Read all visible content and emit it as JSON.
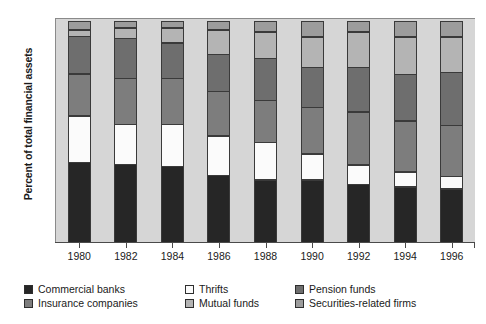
{
  "chart_data": {
    "type": "bar",
    "subtype": "stacked-100-percent",
    "title": "",
    "xlabel": "",
    "ylabel": "Percent of total financial assets",
    "ylim": [
      0,
      100
    ],
    "yticks": [
      0,
      20,
      40,
      60,
      80,
      100
    ],
    "grid": false,
    "legend_position": "bottom",
    "categories": [
      "1980",
      "1982",
      "1984",
      "1986",
      "1988",
      "1990",
      "1992",
      "1994",
      "1996"
    ],
    "series": [
      {
        "name": "Commercial banks",
        "color": "#262626",
        "values": [
          36,
          35,
          34,
          30,
          28,
          28,
          26,
          25,
          24
        ]
      },
      {
        "name": "Thrifts",
        "color": "#fbfbfb",
        "values": [
          21,
          18,
          19,
          18,
          17,
          12,
          9,
          7,
          6
        ]
      },
      {
        "name": "Insurance companies",
        "color": "#7d7d7d",
        "values": [
          19,
          21,
          21,
          20,
          19,
          21,
          24,
          23,
          23
        ]
      },
      {
        "name": "Pension funds",
        "color": "#6e6e6e",
        "values": [
          17,
          18,
          16,
          17,
          19,
          18,
          20,
          21,
          24
        ]
      },
      {
        "name": "Mutual funds",
        "color": "#b4b4b4",
        "values": [
          3,
          5,
          7,
          11,
          12,
          14,
          16,
          17,
          16
        ]
      },
      {
        "name": "Securities-related firms",
        "color": "#9c9c9c",
        "values": [
          4,
          3,
          3,
          4,
          5,
          7,
          5,
          7,
          7
        ]
      }
    ]
  },
  "legend": {
    "entries": [
      "Commercial banks",
      "Thrifts",
      "Pension funds",
      "Insurance companies",
      "Mutual funds",
      "Securities-related firms"
    ]
  },
  "colors": {
    "plot_background": "#d6d6d6",
    "page_background": "#ffffff",
    "axis": "#4a4a4a",
    "segment_border": "#3a3a3a"
  }
}
